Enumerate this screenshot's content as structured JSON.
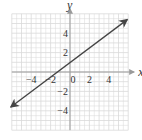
{
  "chart_data": {
    "type": "line",
    "title": "",
    "xlabel": "x",
    "ylabel": "y",
    "xlim": [
      -6,
      6
    ],
    "ylim": [
      -6,
      6
    ],
    "grid": true,
    "x_ticks": [
      -4,
      -2,
      0,
      2,
      4
    ],
    "y_ticks": [
      4,
      2,
      -2,
      -4
    ],
    "x_tick_labels": [
      "−4",
      "−2",
      "0",
      "2",
      "4"
    ],
    "y_tick_labels": [
      "4",
      "2",
      "−2",
      "−4"
    ],
    "series": [
      {
        "name": "line",
        "equation": "y = 0.75x + 1",
        "x": [
          -6.1,
          5.9
        ],
        "y": [
          -3.6,
          5.4
        ],
        "arrows": "both",
        "color": "#444444"
      }
    ],
    "colors": {
      "grid": "#d9d9d9",
      "axis": "#9a9a9a",
      "line": "#444444"
    }
  }
}
